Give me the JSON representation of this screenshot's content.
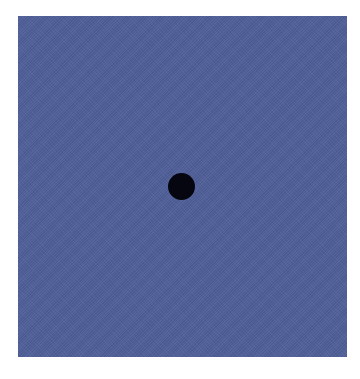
{
  "image": {
    "description": "Blue textured square with a single black dot near the center",
    "colors": {
      "background": "#ffffff",
      "square": "#4f5f99",
      "dot": "#05060f"
    },
    "square": {
      "x": 18,
      "y": 16,
      "width": 329,
      "height": 341
    },
    "dot": {
      "cx": 181,
      "cy": 186,
      "radius": 13
    }
  }
}
